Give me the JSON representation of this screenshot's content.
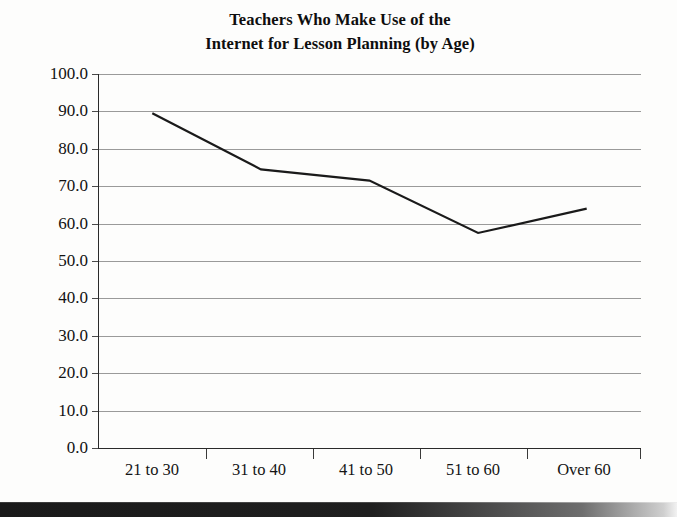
{
  "chart_data": {
    "type": "line",
    "title": "Teachers Who Make Use of the Internet for Lesson Planning (by Age)",
    "title_lines": [
      "Teachers Who Make Use of the",
      "Internet for Lesson Planning (by Age)"
    ],
    "categories": [
      "21 to 30",
      "31 to 40",
      "41 to 50",
      "51 to 60",
      "Over 60"
    ],
    "values": [
      89.5,
      74.5,
      71.5,
      57.5,
      64.0
    ],
    "series": [
      {
        "name": "Percent of teachers using the Internet for lesson planning",
        "values": [
          89.5,
          74.5,
          71.5,
          57.5,
          64.0
        ]
      }
    ],
    "xlabel": "",
    "ylabel": "",
    "ylim": [
      0.0,
      100.0
    ],
    "ytick_labels": [
      "0.0",
      "10.0",
      "20.0",
      "30.0",
      "40.0",
      "50.0",
      "60.0",
      "70.0",
      "80.0",
      "90.0",
      "100.0"
    ],
    "ytick_values": [
      0,
      10,
      20,
      30,
      40,
      50,
      60,
      70,
      80,
      90,
      100
    ],
    "grid": true,
    "grid_axis": "y",
    "legend": false,
    "legend_position": "none",
    "line_color": "#1a1a1a",
    "grid_color": "#9a9a9a",
    "axis_color": "#2a2a2a",
    "background_color": "#fdfdfc",
    "markers": false
  }
}
